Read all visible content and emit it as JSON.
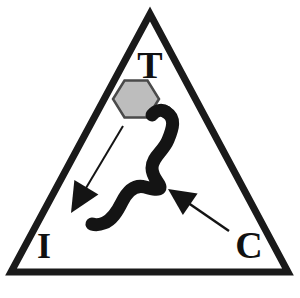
{
  "figure": {
    "name": "triangle-tic-diagram",
    "background_color": "#ffffff",
    "stroke_color": "#1a1a1a",
    "width": 300,
    "height": 298
  },
  "triangle": {
    "name": "outline-triangle",
    "apex": {
      "x": 150,
      "y": 14
    },
    "bottom_left": {
      "x": 11,
      "y": 272
    },
    "bottom_right": {
      "x": 288,
      "y": 272
    },
    "stroke_width": 7,
    "fill": "none",
    "stroke_color": "#1a1a1a"
  },
  "vertex_labels": [
    {
      "id": "T",
      "text": "T",
      "role": "apex-vertex-label",
      "x": 150,
      "y": 78,
      "font_size": 38
    },
    {
      "id": "I",
      "text": "I",
      "role": "bottom-left-vertex-label",
      "x": 44,
      "y": 258,
      "font_size": 36
    },
    {
      "id": "C",
      "text": "C",
      "role": "bottom-right-vertex-label",
      "x": 249,
      "y": 258,
      "font_size": 38
    }
  ],
  "hexagon": {
    "name": "gray-hexagon",
    "center": {
      "x": 136,
      "y": 99
    },
    "radius": 23,
    "fill_color": "#bdbdbd",
    "stroke_color": "#4a4a4a",
    "stroke_width": 2.5,
    "rotation_deg": 0
  },
  "curve_shape": {
    "name": "thick-s-curve",
    "fill_color": "#141414",
    "description": "thick black sigmoid ribbon running from upper right down to lower left"
  },
  "arrows": [
    {
      "id": "arrow-to-i",
      "name": "arrow-pointing-to-i",
      "direction": "down-left",
      "tail": {
        "x": 123,
        "y": 126
      },
      "head": {
        "x": 71,
        "y": 213
      },
      "stroke_width": 2,
      "color": "#141414"
    },
    {
      "id": "arrow-from-c",
      "name": "arrow-pointing-to-curve",
      "direction": "up-left",
      "tail": {
        "x": 229,
        "y": 231
      },
      "head": {
        "x": 168,
        "y": 189
      },
      "stroke_width": 2.5,
      "color": "#141414"
    }
  ]
}
